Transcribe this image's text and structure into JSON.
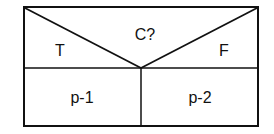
{
  "diagram": {
    "type": "nassi-shneiderman-if-then-else",
    "condition": "C?",
    "true_label": "T",
    "false_label": "F",
    "true_branch": "p-1",
    "false_branch": "p-2"
  }
}
